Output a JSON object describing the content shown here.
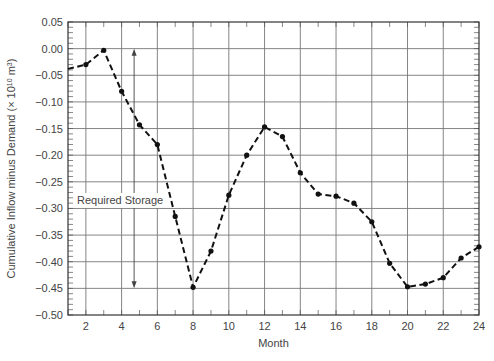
{
  "chart_data": {
    "type": "line",
    "title": "",
    "xlabel": "Month",
    "ylabel": "Cumulative Inflow minus Demand (× 10¹⁰ m³)",
    "ylabel_main": "Cumulative Inflow minus Demand (× 10",
    "ylabel_sup": "10",
    "ylabel_unit": " m",
    "ylabel_unit_sup": "3",
    "ylabel_close": ")",
    "xlim": [
      1,
      24
    ],
    "ylim": [
      -0.5,
      0.05
    ],
    "x_ticks": [
      2,
      4,
      6,
      8,
      10,
      12,
      14,
      16,
      18,
      20,
      22,
      24
    ],
    "y_ticks": [
      0.05,
      0.0,
      -0.05,
      -0.1,
      -0.15,
      -0.2,
      -0.25,
      -0.3,
      -0.35,
      -0.4,
      -0.45,
      -0.5
    ],
    "y_tick_labels": [
      "0.05",
      "0.00",
      "−0.05",
      "−0.10",
      "−0.15",
      "−0.20",
      "−0.25",
      "−0.30",
      "−0.35",
      "−0.40",
      "−0.45",
      "−0.50"
    ],
    "grid": true,
    "legend": null,
    "series": [
      {
        "name": "Cumulative inflow minus demand",
        "style": "dashed-with-markers",
        "x": [
          1,
          2,
          3,
          4,
          5,
          6,
          7,
          8,
          9,
          10,
          11,
          12,
          13,
          14,
          15,
          16,
          17,
          18,
          19,
          20,
          21,
          22,
          23,
          24
        ],
        "values": [
          -0.038,
          -0.03,
          -0.003,
          -0.08,
          -0.143,
          -0.18,
          -0.315,
          -0.448,
          -0.38,
          -0.275,
          -0.2,
          -0.147,
          -0.165,
          -0.233,
          -0.273,
          -0.277,
          -0.29,
          -0.325,
          -0.403,
          -0.447,
          -0.442,
          -0.43,
          -0.393,
          -0.372
        ]
      }
    ],
    "annotations": [
      {
        "text": "Required Storage",
        "type": "double-arrow",
        "x": 4.7,
        "y_from": 0.0,
        "y_to": -0.45
      }
    ]
  }
}
